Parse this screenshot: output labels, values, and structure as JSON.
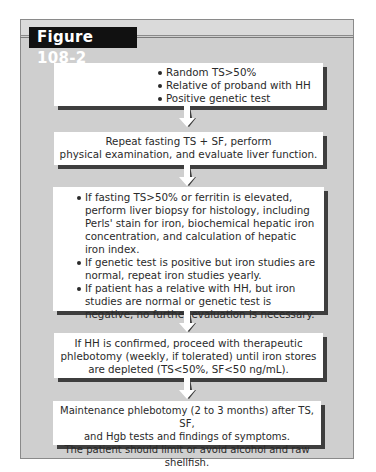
{
  "figure": {
    "label": "Figure 108-2",
    "colors": {
      "frame_bg": "#cfcfcf",
      "box_bg": "#ffffff",
      "box_shadow": "#3e3e3e",
      "label_bg": "#111111",
      "label_text": "#ffffff"
    }
  },
  "flowchart": {
    "steps": [
      {
        "type": "bullets",
        "items": [
          "Random TS>50%",
          "Relative of proband with HH",
          "Positive genetic test"
        ]
      },
      {
        "type": "text",
        "lines": [
          "Repeat fasting TS + SF, perform",
          "physical examination, and evaluate liver function."
        ]
      },
      {
        "type": "bullets",
        "items": [
          "If fasting TS>50% or ferritin is elevated, perform liver biopsy for histology, including Perls' stain for iron, biochemical hepatic iron concentration, and calculation of hepatic iron index.",
          "If genetic test is positive but iron studies are normal, repeat iron studies yearly.",
          "If patient has a relative with HH, but iron studies are normal or genetic test is negative, no further evaluation is necessary."
        ]
      },
      {
        "type": "text",
        "lines": [
          "If HH is confirmed, proceed with therapeutic",
          "phlebotomy (weekly, if tolerated) until iron stores",
          "are depleted (TS<50%, SF<50 ng/mL)."
        ]
      },
      {
        "type": "text",
        "lines": [
          "Maintenance phlebotomy (2 to 3 months) after TS, SF,",
          "and Hgb tests and findings of symptoms.",
          "The patient should limit or avoid alcohol and raw shellfish."
        ]
      }
    ],
    "connectors": [
      {
        "from": 0,
        "to": 1,
        "icon": "down-arrow-icon"
      },
      {
        "from": 1,
        "to": 2,
        "icon": "down-arrow-icon"
      },
      {
        "from": 2,
        "to": 3,
        "icon": "down-arrow-icon"
      },
      {
        "from": 3,
        "to": 4,
        "icon": "down-arrow-icon"
      }
    ]
  }
}
